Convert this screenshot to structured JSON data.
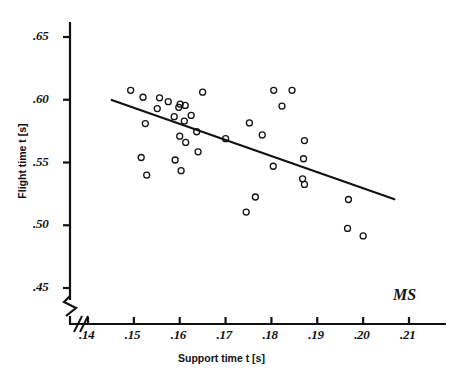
{
  "chart_data": {
    "type": "scatter",
    "title": "",
    "xlabel": "Support time  t [s]",
    "ylabel": "Flight time  t [s]",
    "xlim": [
      0.14,
      0.215
    ],
    "ylim": [
      0.44,
      0.665
    ],
    "grid": false,
    "legend": null,
    "annotations": [
      {
        "text": "MS",
        "x": 0.2045,
        "y": 0.4605
      }
    ],
    "axis_break": {
      "x_axis": true,
      "y_axis": true,
      "note": "zigzag break marks near origin on both axes"
    },
    "xticks": [
      ".14",
      ".15",
      ".16",
      ".17",
      ".18",
      ".19",
      ".20",
      ".21"
    ],
    "xtick_values": [
      0.14,
      0.15,
      0.16,
      0.17,
      0.18,
      0.19,
      0.2,
      0.21
    ],
    "yticks": [
      ".45",
      ".50",
      ".55",
      ".60",
      ".65"
    ],
    "ytick_values": [
      0.45,
      0.5,
      0.55,
      0.6,
      0.65
    ],
    "marker": {
      "shape": "open-circle",
      "radius_px": 3,
      "stroke": "#111111",
      "fill": "none"
    },
    "points": [
      {
        "x": 0.1493,
        "y": 0.6075
      },
      {
        "x": 0.152,
        "y": 0.602
      },
      {
        "x": 0.1525,
        "y": 0.581
      },
      {
        "x": 0.1516,
        "y": 0.554
      },
      {
        "x": 0.1528,
        "y": 0.54
      },
      {
        "x": 0.1556,
        "y": 0.6015
      },
      {
        "x": 0.1551,
        "y": 0.593
      },
      {
        "x": 0.1575,
        "y": 0.5985
      },
      {
        "x": 0.1588,
        "y": 0.5865
      },
      {
        "x": 0.159,
        "y": 0.552
      },
      {
        "x": 0.1601,
        "y": 0.5965
      },
      {
        "x": 0.1598,
        "y": 0.594
      },
      {
        "x": 0.16,
        "y": 0.571
      },
      {
        "x": 0.1603,
        "y": 0.5435
      },
      {
        "x": 0.1612,
        "y": 0.5955
      },
      {
        "x": 0.161,
        "y": 0.583
      },
      {
        "x": 0.1613,
        "y": 0.566
      },
      {
        "x": 0.1625,
        "y": 0.5875
      },
      {
        "x": 0.1637,
        "y": 0.5745
      },
      {
        "x": 0.164,
        "y": 0.5585
      },
      {
        "x": 0.165,
        "y": 0.606
      },
      {
        "x": 0.17,
        "y": 0.569
      },
      {
        "x": 0.1745,
        "y": 0.5105
      },
      {
        "x": 0.1765,
        "y": 0.5225
      },
      {
        "x": 0.1752,
        "y": 0.5815
      },
      {
        "x": 0.178,
        "y": 0.572
      },
      {
        "x": 0.1805,
        "y": 0.6075
      },
      {
        "x": 0.1804,
        "y": 0.547
      },
      {
        "x": 0.1823,
        "y": 0.595
      },
      {
        "x": 0.1845,
        "y": 0.6075
      },
      {
        "x": 0.1872,
        "y": 0.5675
      },
      {
        "x": 0.187,
        "y": 0.553
      },
      {
        "x": 0.1868,
        "y": 0.537
      },
      {
        "x": 0.1872,
        "y": 0.5325
      },
      {
        "x": 0.1968,
        "y": 0.5205
      },
      {
        "x": 0.1966,
        "y": 0.4975
      },
      {
        "x": 0.2,
        "y": 0.4915
      }
    ],
    "trendline": {
      "type": "linear-fit",
      "x_start": 0.145,
      "y_start": 0.6,
      "x_end": 0.207,
      "y_end": 0.5205,
      "stroke": "#111111"
    }
  },
  "colors": {
    "background": "#ffffff",
    "ink": "#111111"
  }
}
